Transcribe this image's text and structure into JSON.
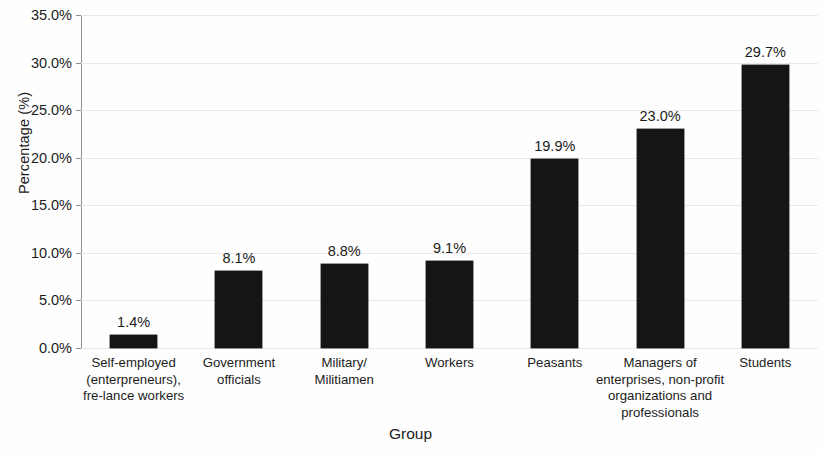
{
  "chart_data": {
    "type": "bar",
    "title": "",
    "xlabel": "Group",
    "ylabel": "Percentage (%)",
    "categories": [
      "Self-employed (enterpreneurs), fre-lance workers",
      "Government officials",
      "Military/ Militiamen",
      "Workers",
      "Peasants",
      "Managers of enterprises, non-profit organizations and professionals",
      "Students"
    ],
    "category_lines": [
      [
        "Self-employed",
        "(enterpreneurs),",
        "fre-lance workers"
      ],
      [
        "Government",
        "officials"
      ],
      [
        "Military/",
        "Militiamen"
      ],
      [
        "Workers"
      ],
      [
        "Peasants"
      ],
      [
        "Managers of",
        "enterprises, non-profit",
        "organizations and",
        "professionals"
      ],
      [
        "Students"
      ]
    ],
    "values": [
      1.4,
      8.1,
      8.8,
      9.1,
      19.9,
      23.0,
      29.7
    ],
    "value_labels": [
      "1.4%",
      "8.1%",
      "8.8%",
      "9.1%",
      "19.9%",
      "23.0%",
      "29.7%"
    ],
    "ylim": [
      0,
      35
    ],
    "ytick_values": [
      0,
      5,
      10,
      15,
      20,
      25,
      30,
      35
    ],
    "ytick_labels": [
      "0.0%",
      "5.0%",
      "10.0%",
      "15.0%",
      "20.0%",
      "25.0%",
      "30.0%",
      "35.0%"
    ],
    "grid": true,
    "legend": false,
    "bar_color": "#151515",
    "gridline_color": "#e9e9ea",
    "axis_color": "#8f8f90",
    "background_color": "#ffffff"
  }
}
